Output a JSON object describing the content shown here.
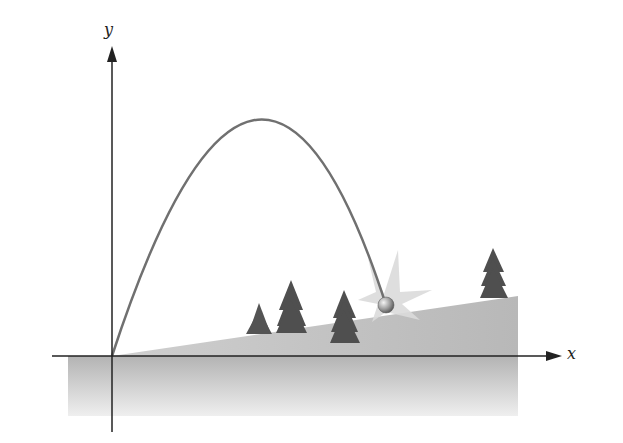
{
  "figure": {
    "axes": {
      "x_label": "x",
      "y_label": "y"
    },
    "colors": {
      "trajectory": "#6e6e6e",
      "axis": "#222222",
      "ground_top": "#b5b5b5",
      "ground_bottom": "#eeeeee",
      "tree": "#555555",
      "burst": "#d9d9d9",
      "ball": "#9a9a9a"
    },
    "elements": {
      "trees_count": 4,
      "has_impact_burst": true,
      "has_ball": true
    }
  }
}
